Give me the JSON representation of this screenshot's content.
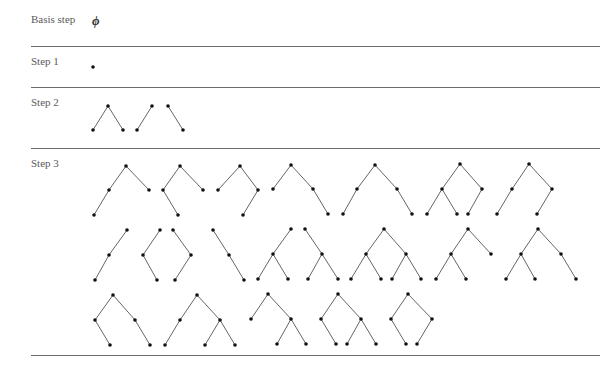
{
  "rows": [
    {
      "label": "Basis step",
      "top": 13
    },
    {
      "label": "Step 1",
      "top": 55
    },
    {
      "label": "Step 2",
      "top": 96
    },
    {
      "label": "Step 3",
      "top": 157
    }
  ],
  "basis_symbol": "ϕ",
  "rules": [
    {
      "y": 46,
      "x1": 31,
      "x2": 600
    },
    {
      "y": 87,
      "x1": 31,
      "x2": 600
    },
    {
      "y": 148,
      "x1": 31,
      "x2": 600
    },
    {
      "y": 355,
      "x1": 31,
      "x2": 600
    }
  ],
  "trees": [
    {
      "step": 1,
      "nodes": [
        [
          93,
          67
        ]
      ],
      "edges": []
    },
    {
      "step": 2,
      "nodes": [
        [
          108,
          106
        ],
        [
          93,
          130
        ],
        [
          123,
          130
        ]
      ],
      "edges": [
        [
          0,
          1
        ],
        [
          0,
          2
        ]
      ]
    },
    {
      "step": 2,
      "nodes": [
        [
          152,
          106
        ],
        [
          137,
          130
        ]
      ],
      "edges": [
        [
          0,
          1
        ]
      ]
    },
    {
      "step": 2,
      "nodes": [
        [
          168,
          106
        ],
        [
          183,
          130
        ]
      ],
      "edges": [
        [
          0,
          1
        ]
      ]
    },
    {
      "step": 3,
      "nodes": [
        [
          126,
          166
        ],
        [
          109,
          190
        ],
        [
          149,
          190
        ],
        [
          94,
          215
        ]
      ],
      "edges": [
        [
          0,
          1
        ],
        [
          0,
          2
        ],
        [
          1,
          3
        ]
      ]
    },
    {
      "step": 3,
      "nodes": [
        [
          180,
          166
        ],
        [
          163,
          190
        ],
        [
          203,
          190
        ],
        [
          178,
          215
        ]
      ],
      "edges": [
        [
          0,
          1
        ],
        [
          0,
          2
        ],
        [
          1,
          3
        ]
      ]
    },
    {
      "step": 3,
      "nodes": [
        [
          240,
          166
        ],
        [
          218,
          190
        ],
        [
          258,
          190
        ],
        [
          243,
          215
        ]
      ],
      "edges": [
        [
          0,
          1
        ],
        [
          0,
          2
        ],
        [
          2,
          3
        ]
      ]
    },
    {
      "step": 3,
      "nodes": [
        [
          291,
          165
        ],
        [
          273,
          189
        ],
        [
          313,
          189
        ],
        [
          328,
          214
        ]
      ],
      "edges": [
        [
          0,
          1
        ],
        [
          0,
          2
        ],
        [
          2,
          3
        ]
      ]
    },
    {
      "step": 3,
      "nodes": [
        [
          375,
          165
        ],
        [
          357,
          189
        ],
        [
          397,
          189
        ],
        [
          343,
          214
        ],
        [
          412,
          214
        ]
      ],
      "edges": [
        [
          0,
          1
        ],
        [
          0,
          2
        ],
        [
          1,
          3
        ],
        [
          2,
          4
        ]
      ]
    },
    {
      "step": 3,
      "nodes": [
        [
          460,
          164
        ],
        [
          442,
          189
        ],
        [
          482,
          189
        ],
        [
          427,
          214
        ],
        [
          457,
          214
        ],
        [
          468,
          214
        ]
      ],
      "edges": [
        [
          0,
          1
        ],
        [
          0,
          2
        ],
        [
          1,
          3
        ],
        [
          1,
          4
        ],
        [
          2,
          5
        ]
      ]
    },
    {
      "step": 3,
      "nodes": [
        [
          529,
          164
        ],
        [
          512,
          189
        ],
        [
          552,
          189
        ],
        [
          497,
          214
        ],
        [
          537,
          214
        ]
      ],
      "edges": [
        [
          0,
          1
        ],
        [
          0,
          2
        ],
        [
          1,
          3
        ],
        [
          2,
          4
        ]
      ]
    },
    {
      "step": 3,
      "nodes": [
        [
          127,
          230
        ],
        [
          109,
          255
        ],
        [
          95,
          280
        ]
      ],
      "edges": [
        [
          0,
          1
        ],
        [
          1,
          2
        ]
      ]
    },
    {
      "step": 3,
      "nodes": [
        [
          160,
          230
        ],
        [
          143,
          255
        ],
        [
          157,
          280
        ]
      ],
      "edges": [
        [
          0,
          1
        ],
        [
          1,
          2
        ]
      ]
    },
    {
      "step": 3,
      "nodes": [
        [
          173,
          230
        ],
        [
          191,
          255
        ],
        [
          175,
          280
        ]
      ],
      "edges": [
        [
          0,
          1
        ],
        [
          1,
          2
        ]
      ]
    },
    {
      "step": 3,
      "nodes": [
        [
          213,
          230
        ],
        [
          229,
          255
        ],
        [
          244,
          280
        ]
      ],
      "edges": [
        [
          0,
          1
        ],
        [
          1,
          2
        ]
      ]
    },
    {
      "step": 3,
      "nodes": [
        [
          291,
          229
        ],
        [
          273,
          254
        ],
        [
          258,
          279
        ],
        [
          288,
          279
        ]
      ],
      "edges": [
        [
          0,
          1
        ],
        [
          1,
          2
        ],
        [
          1,
          3
        ]
      ]
    },
    {
      "step": 3,
      "nodes": [
        [
          305,
          229
        ],
        [
          322,
          254
        ],
        [
          308,
          279
        ],
        [
          338,
          279
        ]
      ],
      "edges": [
        [
          0,
          1
        ],
        [
          1,
          2
        ],
        [
          1,
          3
        ]
      ]
    },
    {
      "step": 3,
      "nodes": [
        [
          384,
          229
        ],
        [
          366,
          254
        ],
        [
          406,
          254
        ],
        [
          351,
          279
        ],
        [
          381,
          279
        ],
        [
          392,
          279
        ],
        [
          421,
          279
        ]
      ],
      "edges": [
        [
          0,
          1
        ],
        [
          0,
          2
        ],
        [
          1,
          3
        ],
        [
          1,
          4
        ],
        [
          2,
          5
        ],
        [
          2,
          6
        ]
      ]
    },
    {
      "step": 3,
      "nodes": [
        [
          468,
          229
        ],
        [
          451,
          254
        ],
        [
          491,
          254
        ],
        [
          436,
          279
        ],
        [
          466,
          279
        ]
      ],
      "edges": [
        [
          0,
          1
        ],
        [
          0,
          2
        ],
        [
          1,
          3
        ],
        [
          1,
          4
        ]
      ]
    },
    {
      "step": 3,
      "nodes": [
        [
          538,
          229
        ],
        [
          521,
          254
        ],
        [
          561,
          254
        ],
        [
          506,
          279
        ],
        [
          535,
          279
        ],
        [
          576,
          279
        ]
      ],
      "edges": [
        [
          0,
          1
        ],
        [
          0,
          2
        ],
        [
          1,
          3
        ],
        [
          1,
          4
        ],
        [
          2,
          5
        ]
      ]
    },
    {
      "step": 3,
      "nodes": [
        [
          113,
          295
        ],
        [
          95,
          320
        ],
        [
          135,
          320
        ],
        [
          110,
          345
        ],
        [
          150,
          345
        ]
      ],
      "edges": [
        [
          0,
          1
        ],
        [
          0,
          2
        ],
        [
          1,
          3
        ],
        [
          2,
          4
        ]
      ]
    },
    {
      "step": 3,
      "nodes": [
        [
          197,
          295
        ],
        [
          180,
          320
        ],
        [
          220,
          320
        ],
        [
          165,
          345
        ],
        [
          205,
          345
        ],
        [
          235,
          345
        ]
      ],
      "edges": [
        [
          0,
          1
        ],
        [
          0,
          2
        ],
        [
          1,
          3
        ],
        [
          2,
          4
        ],
        [
          2,
          5
        ]
      ]
    },
    {
      "step": 3,
      "nodes": [
        [
          268,
          294
        ],
        [
          251,
          319
        ],
        [
          291,
          319
        ],
        [
          277,
          344
        ],
        [
          306,
          344
        ]
      ],
      "edges": [
        [
          0,
          1
        ],
        [
          0,
          2
        ],
        [
          2,
          3
        ],
        [
          2,
          4
        ]
      ]
    },
    {
      "step": 3,
      "nodes": [
        [
          338,
          294
        ],
        [
          321,
          319
        ],
        [
          361,
          319
        ],
        [
          336,
          344
        ],
        [
          347,
          344
        ],
        [
          376,
          344
        ]
      ],
      "edges": [
        [
          0,
          1
        ],
        [
          0,
          2
        ],
        [
          1,
          3
        ],
        [
          2,
          4
        ],
        [
          2,
          5
        ]
      ]
    },
    {
      "step": 3,
      "nodes": [
        [
          408,
          294
        ],
        [
          391,
          319
        ],
        [
          432,
          319
        ],
        [
          406,
          344
        ],
        [
          417,
          344
        ]
      ],
      "edges": [
        [
          0,
          1
        ],
        [
          0,
          2
        ],
        [
          1,
          3
        ],
        [
          2,
          4
        ]
      ]
    }
  ],
  "colors": {
    "edge": "#666666",
    "node": "#111111",
    "rule": "#6b6b6b"
  }
}
